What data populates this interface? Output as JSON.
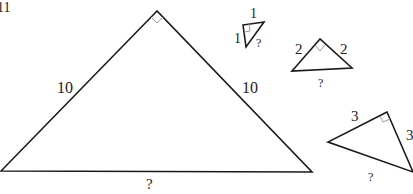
{
  "problem_number": "11",
  "colors": {
    "stroke": "#1a1a1a",
    "right_angle_mark": "#9a9a9a",
    "text": "#222222",
    "background": "#ffffff"
  },
  "triangles": [
    {
      "id": "large",
      "legs": [
        "10",
        "10"
      ],
      "hypotenuse": "?",
      "right_angle": true
    },
    {
      "id": "tiny",
      "legs": [
        "1",
        "1"
      ],
      "hypotenuse": "?",
      "right_angle": true
    },
    {
      "id": "medium",
      "legs": [
        "2",
        "2"
      ],
      "hypotenuse": "?",
      "right_angle": true
    },
    {
      "id": "rotated",
      "legs": [
        "3",
        "3"
      ],
      "hypotenuse": "?",
      "right_angle": true
    }
  ]
}
